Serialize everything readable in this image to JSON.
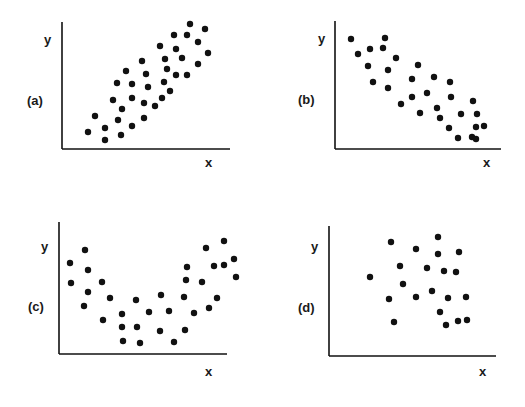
{
  "chart_data": [
    {
      "type": "scatter",
      "panel": "(a)",
      "title": "",
      "xlabel": "x",
      "ylabel": "y",
      "description": "positive linear correlation",
      "grid": false,
      "axis": {
        "origin": [
          62,
          149
        ],
        "x_end": 230,
        "y_top": 22
      },
      "points": [
        [
          88,
          132
        ],
        [
          95,
          116
        ],
        [
          105,
          128
        ],
        [
          105,
          140
        ],
        [
          118,
          120
        ],
        [
          121,
          135
        ],
        [
          113,
          100
        ],
        [
          122,
          109
        ],
        [
          132,
          126
        ],
        [
          132,
          98
        ],
        [
          117,
          83
        ],
        [
          126,
          71
        ],
        [
          132,
          84
        ],
        [
          144,
          118
        ],
        [
          144,
          103
        ],
        [
          142,
          61
        ],
        [
          146,
          74
        ],
        [
          148,
          87
        ],
        [
          155,
          106
        ],
        [
          162,
          98
        ],
        [
          164,
          82
        ],
        [
          167,
          69
        ],
        [
          170,
          91
        ],
        [
          160,
          46
        ],
        [
          165,
          59
        ],
        [
          176,
          49
        ],
        [
          182,
          58
        ],
        [
          176,
          75
        ],
        [
          187,
          75
        ],
        [
          174,
          35
        ],
        [
          187,
          35
        ],
        [
          190,
          24
        ],
        [
          198,
          42
        ],
        [
          205,
          29
        ],
        [
          208,
          53
        ],
        [
          198,
          64
        ]
      ]
    },
    {
      "type": "scatter",
      "panel": "(b)",
      "title": "",
      "xlabel": "x",
      "ylabel": "y",
      "description": "negative linear correlation",
      "grid": false,
      "axis": {
        "origin": [
          335,
          149
        ],
        "x_end": 501,
        "y_top": 21
      },
      "points": [
        [
          351,
          39
        ],
        [
          358,
          54
        ],
        [
          370,
          49
        ],
        [
          383,
          48
        ],
        [
          385,
          38
        ],
        [
          368,
          66
        ],
        [
          373,
          82
        ],
        [
          388,
          70
        ],
        [
          396,
          58
        ],
        [
          388,
          88
        ],
        [
          401,
          104
        ],
        [
          412,
          79
        ],
        [
          418,
          65
        ],
        [
          412,
          97
        ],
        [
          420,
          113
        ],
        [
          427,
          93
        ],
        [
          434,
          77
        ],
        [
          437,
          108
        ],
        [
          440,
          118
        ],
        [
          449,
          128
        ],
        [
          450,
          82
        ],
        [
          451,
          97
        ],
        [
          458,
          138
        ],
        [
          461,
          114
        ],
        [
          473,
          101
        ],
        [
          476,
          127
        ],
        [
          477,
          114
        ],
        [
          472,
          137
        ],
        [
          484,
          126
        ],
        [
          476,
          139
        ]
      ]
    },
    {
      "type": "scatter",
      "panel": "(c)",
      "title": "",
      "xlabel": "x",
      "ylabel": "y",
      "description": "curvilinear (U-shaped) relationship",
      "grid": false,
      "axis": {
        "origin": [
          59,
          354
        ],
        "x_end": 227,
        "y_top": 222
      },
      "points": [
        [
          70,
          263
        ],
        [
          71,
          283
        ],
        [
          85,
          250
        ],
        [
          88,
          270
        ],
        [
          88,
          292
        ],
        [
          84,
          306
        ],
        [
          102,
          282
        ],
        [
          103,
          320
        ],
        [
          110,
          298
        ],
        [
          122,
          314
        ],
        [
          122,
          327
        ],
        [
          123,
          341
        ],
        [
          136,
          300
        ],
        [
          137,
          327
        ],
        [
          140,
          343
        ],
        [
          149,
          312
        ],
        [
          161,
          295
        ],
        [
          160,
          331
        ],
        [
          169,
          311
        ],
        [
          174,
          342
        ],
        [
          185,
          330
        ],
        [
          184,
          297
        ],
        [
          186,
          280
        ],
        [
          187,
          267
        ],
        [
          194,
          313
        ],
        [
          202,
          282
        ],
        [
          209,
          308
        ],
        [
          217,
          298
        ],
        [
          206,
          248
        ],
        [
          214,
          266
        ],
        [
          224,
          241
        ],
        [
          224,
          265
        ],
        [
          234,
          259
        ],
        [
          236,
          277
        ]
      ]
    },
    {
      "type": "scatter",
      "panel": "(d)",
      "title": "",
      "xlabel": "x",
      "ylabel": "y",
      "description": "no correlation",
      "grid": false,
      "axis": {
        "origin": [
          329,
          356
        ],
        "x_end": 496,
        "y_top": 226
      },
      "points": [
        [
          370,
          277
        ],
        [
          391,
          242
        ],
        [
          389,
          299
        ],
        [
          394,
          322
        ],
        [
          400,
          266
        ],
        [
          403,
          284
        ],
        [
          416,
          249
        ],
        [
          416,
          297
        ],
        [
          427,
          268
        ],
        [
          438,
          237
        ],
        [
          438,
          254
        ],
        [
          432,
          291
        ],
        [
          440,
          312
        ],
        [
          446,
          325
        ],
        [
          444,
          271
        ],
        [
          448,
          298
        ],
        [
          459,
          252
        ],
        [
          456,
          272
        ],
        [
          458,
          321
        ],
        [
          466,
          297
        ],
        [
          467,
          320
        ]
      ]
    }
  ],
  "panels": [
    {
      "tag": "(a)",
      "y_label": "y",
      "x_label": "x"
    },
    {
      "tag": "(b)",
      "y_label": "y",
      "x_label": "x"
    },
    {
      "tag": "(c)",
      "y_label": "y",
      "x_label": "x"
    },
    {
      "tag": "(d)",
      "y_label": "y",
      "x_label": "x"
    }
  ],
  "colors": {
    "ink": "#111111",
    "background": "#ffffff"
  }
}
